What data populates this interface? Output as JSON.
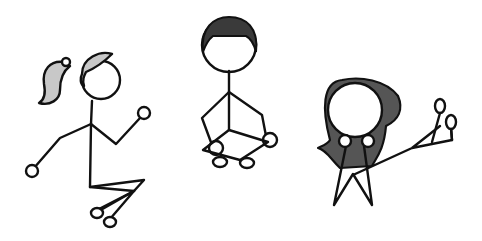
{
  "scene": {
    "description": "Three hand-drawn stick figures on a white background",
    "figures": [
      {
        "name": "girl-with-ponytail",
        "pose": "running",
        "hair_color": "#c8c8c8"
      },
      {
        "name": "boy-sitting",
        "pose": "sitting cross-legged",
        "hair_color": "#3a3a3a"
      },
      {
        "name": "figure-with-hood",
        "pose": "waving / reaching",
        "hair_color": "#555555"
      }
    ],
    "colors": {
      "background": "#ffffff",
      "stroke": "#111111"
    }
  }
}
